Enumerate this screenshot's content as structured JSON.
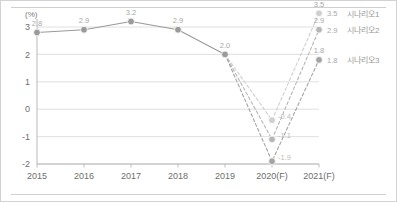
{
  "chart_data": {
    "type": "line",
    "title": "",
    "subtitle": "",
    "xlabel": "",
    "ylabel": "",
    "unit_label": "(%)",
    "categories": [
      "2015",
      "2016",
      "2017",
      "2018",
      "2019",
      "2020(F)",
      "2021(F)"
    ],
    "ylim": [
      -2,
      3
    ],
    "yticks": [
      "3",
      "2",
      "1",
      "0",
      "-1",
      "-2"
    ],
    "ytick_values": [
      3,
      2,
      1,
      0,
      -1,
      -2
    ],
    "grid": true,
    "legend_position": "right",
    "series": [
      {
        "name": "실적",
        "style": "solid",
        "values": [
          2.8,
          2.9,
          3.2,
          2.9,
          2.0,
          null,
          null
        ],
        "labels": [
          "2.8",
          "2.9",
          "3.2",
          "2.9",
          "2.0",
          "",
          ""
        ],
        "color": "#9a9a9a"
      },
      {
        "name": "시나리오1",
        "style": "dashed",
        "values": [
          null,
          null,
          null,
          null,
          2.0,
          -0.4,
          3.5
        ],
        "labels": [
          "",
          "",
          "",
          "",
          "",
          "-0.4",
          "3.5"
        ],
        "color": "#cfcfcf"
      },
      {
        "name": "시나리오2",
        "style": "dashed",
        "values": [
          null,
          null,
          null,
          null,
          2.0,
          -1.1,
          2.9
        ],
        "labels": [
          "",
          "",
          "",
          "",
          "",
          "-1.1",
          "2.9"
        ],
        "color": "#b6b6b6"
      },
      {
        "name": "시나리오3",
        "style": "dashed",
        "values": [
          null,
          null,
          null,
          null,
          2.0,
          -1.9,
          1.8
        ],
        "labels": [
          "",
          "",
          "",
          "",
          "",
          "-1.9",
          "1.8"
        ],
        "color": "#a3a3a3"
      }
    ],
    "annotations": [
      {
        "text": "-0.4",
        "x": "2020(F)",
        "y": -0.4
      },
      {
        "text": "-1.1",
        "x": "2020(F)",
        "y": -1.1
      },
      {
        "text": "-1.9",
        "x": "2020(F)",
        "y": -1.9
      }
    ],
    "legend": [
      {
        "label": "시나리오1",
        "value": "3.5",
        "color": "#cfcfcf"
      },
      {
        "label": "시나리오2",
        "value": "2.9",
        "color": "#b6b6b6"
      },
      {
        "label": "시나리오3",
        "value": "1.8",
        "color": "#a3a3a3"
      }
    ]
  },
  "colors": {
    "frame_border": "#d2d2d2",
    "grid": "#d8d8d8",
    "axis": "#b0b0b0",
    "text": "#6e6e6e",
    "label": "#a8a8a8"
  }
}
